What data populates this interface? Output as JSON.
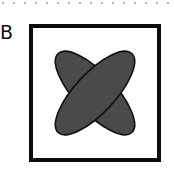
{
  "figure": {
    "label": "B",
    "frame": {
      "stroke": "#0c0c0c",
      "fill": "#ffffff"
    },
    "shapes": [
      {
        "type": "ellipse",
        "orientation": "backslash",
        "rotation_deg": 47,
        "fill": "#4a4a4a",
        "stroke": "#111111"
      },
      {
        "type": "ellipse",
        "orientation": "slash",
        "rotation_deg": -47,
        "fill": "#4a4a4a",
        "stroke": "#111111"
      }
    ],
    "separator": {
      "style": "dotted",
      "color": "#9a9a9a"
    }
  }
}
